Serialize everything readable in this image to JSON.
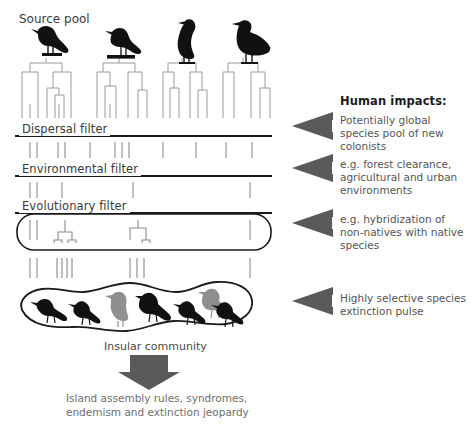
{
  "figure": {
    "type": "conceptual-filter-diagram",
    "background": "#ffffff",
    "arrow_color": "#5a5a5a",
    "line_color": "#1a1a1a",
    "tree_color": "#9a9a9a",
    "tick_color": "#8a8a8a",
    "bird_dark": "#111111",
    "bird_gray": "#8f8f8f"
  },
  "labels": {
    "source_pool": "Source pool",
    "dispersal_filter": "Dispersal filter",
    "environmental_filter": "Environmental filter",
    "evolutionary_filter": "Evolutionary filter",
    "insular_community": "Insular community"
  },
  "human_impacts": {
    "heading": "Human impacts:",
    "items": [
      {
        "id": "impact-dispersal",
        "text": "Potentially global species pool of new colonists"
      },
      {
        "id": "impact-environmental",
        "text": "e.g. forest clearance, agricultural and urban environments"
      },
      {
        "id": "impact-evolutionary",
        "text": "e.g. hybridization of non-natives with native species"
      },
      {
        "id": "impact-extinction",
        "text": "Highly selective species extinction pulse"
      }
    ]
  },
  "outcome_caption": "Island assembly rules, syndromes,\nendemism and extinction jeopardy",
  "source_pool_clades": [
    {
      "id": "clade-1",
      "bird": "perched-songbird",
      "bird_fill": "#111111",
      "x": 20,
      "leaves": 6
    },
    {
      "id": "clade-2",
      "bird": "perched-songbird",
      "bird_fill": "#111111",
      "x": 95,
      "leaves": 6
    },
    {
      "id": "clade-3",
      "bird": "standing-cormorant",
      "bird_fill": "#111111",
      "x": 163,
      "leaves": 6
    },
    {
      "id": "clade-4",
      "bird": "standing-grouse",
      "bird_fill": "#111111",
      "x": 225,
      "leaves": 6
    }
  ],
  "tick_rows": [
    {
      "id": "ticks-below-source",
      "y": 104,
      "height": 14,
      "count": 25
    },
    {
      "id": "ticks-below-dispersal",
      "y": 140,
      "height": 16,
      "count": 12
    },
    {
      "id": "ticks-below-environmental",
      "y": 180,
      "height": 16,
      "count": 6
    },
    {
      "id": "ticks-in-box",
      "y": 218,
      "height": 18,
      "count": 5
    },
    {
      "id": "ticks-below-box",
      "y": 258,
      "height": 18,
      "count": 9
    }
  ],
  "island_birds": [
    {
      "id": "island-bird-1",
      "fill": "#111111"
    },
    {
      "id": "island-bird-2",
      "fill": "#111111"
    },
    {
      "id": "island-bird-3",
      "fill": "#8f8f8f"
    },
    {
      "id": "island-bird-4",
      "fill": "#111111"
    },
    {
      "id": "island-bird-5",
      "fill": "#111111"
    },
    {
      "id": "island-bird-6",
      "fill": "#8f8f8f"
    },
    {
      "id": "island-bird-7",
      "fill": "#111111"
    }
  ]
}
